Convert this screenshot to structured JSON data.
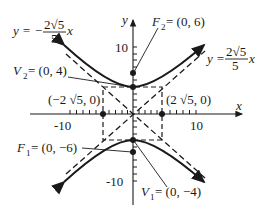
{
  "diagram": {
    "type": "hyperbola",
    "equation_form": "vertical transverse axis",
    "axes": {
      "x_label": "x",
      "y_label": "y",
      "x_ticks": [
        "-10",
        "10"
      ],
      "y_ticks": [
        "10",
        "-10"
      ]
    },
    "asymptotes": {
      "positive": {
        "prefix": "y = ",
        "num": "2√5",
        "den": "5",
        "suffix": "x"
      },
      "negative": {
        "prefix": "y = −",
        "num": "2√5",
        "den": "5",
        "suffix": "x"
      }
    },
    "points": {
      "F2": {
        "name": "F",
        "sub": "2",
        "value": " = (0, 6)"
      },
      "V2": {
        "name": "V",
        "sub": "2",
        "value": " = (0, 4)"
      },
      "F1": {
        "name": "F",
        "sub": "1",
        "value": " = (0, −6)"
      },
      "V1": {
        "name": "V",
        "sub": "1",
        "value": " = (0, −4)"
      },
      "left_co": {
        "label": "(−2 √5, 0)"
      },
      "right_co": {
        "label": "(2 √5, 0)"
      }
    }
  }
}
